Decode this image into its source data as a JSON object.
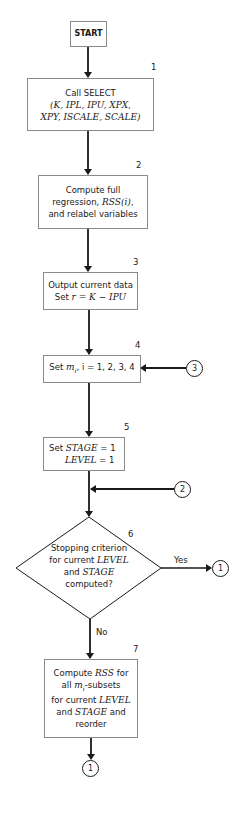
{
  "flowchart": {
    "start": {
      "label": "START"
    },
    "steps": [
      {
        "number": "1",
        "lines": [
          "Call SELECT",
          "(K, IPL, IPU, XPX,",
          "XPY, ISCALE, SCALE)"
        ]
      },
      {
        "number": "2",
        "line1": "Compute full",
        "line2_pre": "regression, ",
        "line2_it": "RSS",
        "line2_post": "(i),",
        "line3": "and relabel variables"
      },
      {
        "number": "3",
        "line1": "Output current data",
        "line2_pre": "Set ",
        "line2_it": "r = K − IPU"
      },
      {
        "number": "4",
        "pre": "Set ",
        "it": "m",
        "sub": "i",
        "post": ", i = 1, 2, 3, 4"
      },
      {
        "number": "5",
        "line1_pre": "Set ",
        "line1_it": "STAGE",
        "line1_post": " = 1",
        "line2_it": "LEVEL",
        "line2_post": " = 1"
      },
      {
        "number": "6",
        "line1": "Stopping criterion",
        "line2_pre": "for current ",
        "line2_it": "LEVEL",
        "line3_pre": "and ",
        "line3_it": "STAGE",
        "line4": "computed?"
      },
      {
        "number": "7",
        "line1_pre": "Compute ",
        "line1_it": "RSS",
        "line1_post": " for",
        "line2_pre": "all ",
        "line2_it": "m",
        "line2_sub": "i",
        "line2_post": "-subsets",
        "line3_pre": "for current ",
        "line3_it": "LEVEL",
        "line4_pre": "and ",
        "line4_it": "STAGE",
        "line4_post": " and",
        "line5": "reorder"
      }
    ],
    "branches": {
      "yes": "Yes",
      "no": "No"
    },
    "connectors": {
      "into_step4": "3",
      "into_step6": "2",
      "yes_exit": "1",
      "bottom_exit": "1"
    },
    "colors": {
      "line": "#1a1a1a",
      "box_border": "#8a8a8a",
      "background": "#ffffff"
    }
  }
}
